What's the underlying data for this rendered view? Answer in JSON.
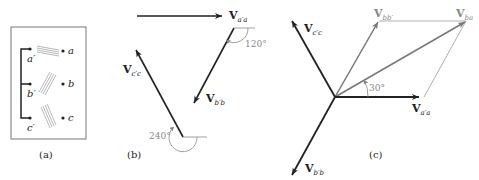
{
  "panel_a": {
    "caption": "(a)",
    "terminals_left": [
      "a′",
      "b′",
      "c′"
    ],
    "terminals_right": [
      "a",
      "b",
      "c"
    ]
  },
  "panel_b": {
    "caption": "(b)",
    "vectors": {
      "vaa": {
        "base": "V",
        "sub": "a′a"
      },
      "vbb": {
        "base": "V",
        "sub": "b′b"
      },
      "vcc": {
        "base": "V",
        "sub": "c′c"
      }
    },
    "angles": [
      "120°",
      "240°"
    ]
  },
  "panel_c": {
    "caption": "(c)",
    "vectors": {
      "vcc": {
        "base": "V",
        "sub": "c′c"
      },
      "vbb_prime": {
        "base": "V",
        "sub": "bb′"
      },
      "vba": {
        "base": "V",
        "sub": "ba"
      },
      "vaa": {
        "base": "V",
        "sub": "a′a"
      },
      "vbb": {
        "base": "V",
        "sub": "b′b"
      }
    },
    "angle": "30°"
  }
}
